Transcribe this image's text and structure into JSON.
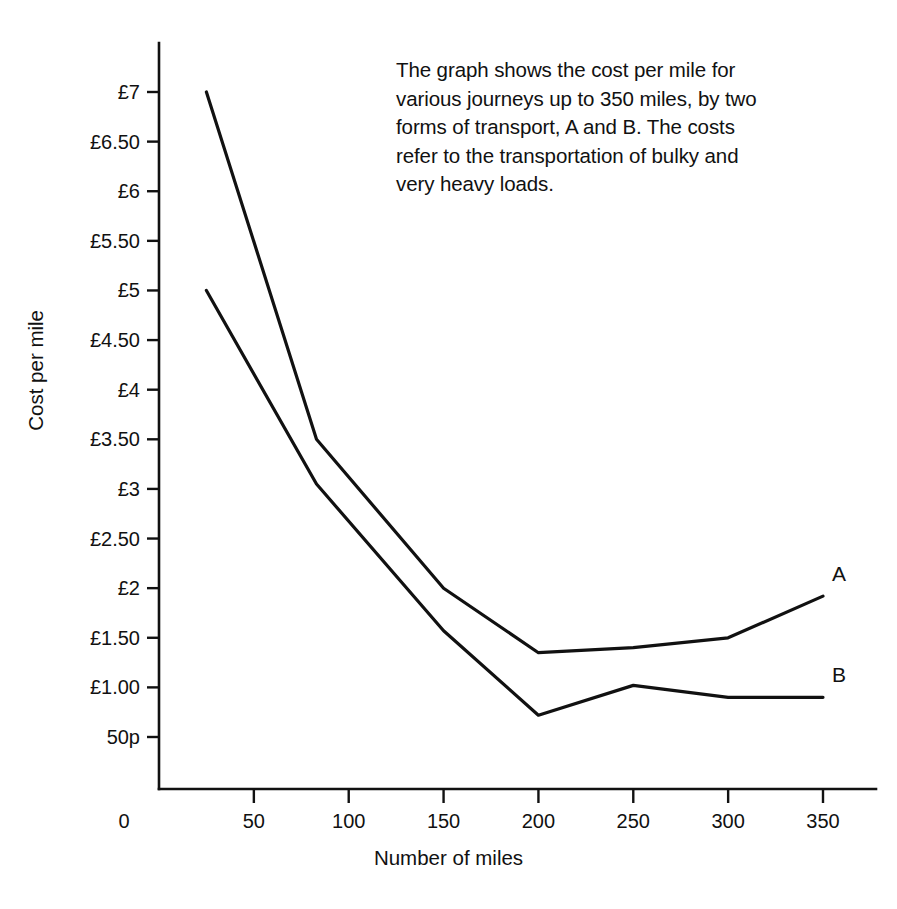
{
  "caption": {
    "text": "The graph shows the cost per mile for\nvarious journeys up to 350 miles, by two\nforms of transport, A and B. The costs\nrefer to the transportation of bulky and\nvery heavy loads."
  },
  "chart_data": {
    "type": "line",
    "title": "",
    "xlabel": "Number of miles",
    "ylabel": "Cost per mile",
    "xlim": [
      0,
      365
    ],
    "ylim": [
      0.5,
      7.25
    ],
    "grid": false,
    "legend_position": "line-end",
    "x_ticks": [
      0,
      50,
      100,
      150,
      200,
      250,
      300,
      350
    ],
    "x_tick_labels": [
      "0",
      "50",
      "100",
      "150",
      "200",
      "250",
      "300",
      "350"
    ],
    "y_ticks": [
      7,
      6.5,
      6,
      5.5,
      5,
      4.5,
      4,
      3.5,
      3,
      2.5,
      2,
      1.5,
      1.0,
      0.5
    ],
    "y_tick_labels": [
      "£7",
      "£6.50",
      "£6",
      "£5.50",
      "£5",
      "£4.50",
      "£4",
      "£3.50",
      "£3",
      "£2.50",
      "£2",
      "£1.50",
      "£1.00",
      "50p"
    ],
    "currency_symbol": "£",
    "series": [
      {
        "name": "A",
        "label": "A",
        "color": "#111111",
        "x": [
          25,
          83,
          150,
          200,
          250,
          300,
          350
        ],
        "values": [
          7.0,
          3.5,
          2.0,
          1.35,
          1.4,
          1.5,
          1.92
        ]
      },
      {
        "name": "B",
        "label": "B",
        "color": "#111111",
        "x": [
          25,
          83,
          150,
          200,
          250,
          300,
          350
        ],
        "values": [
          5.0,
          3.05,
          1.57,
          0.72,
          1.02,
          0.9,
          0.9
        ]
      }
    ]
  }
}
